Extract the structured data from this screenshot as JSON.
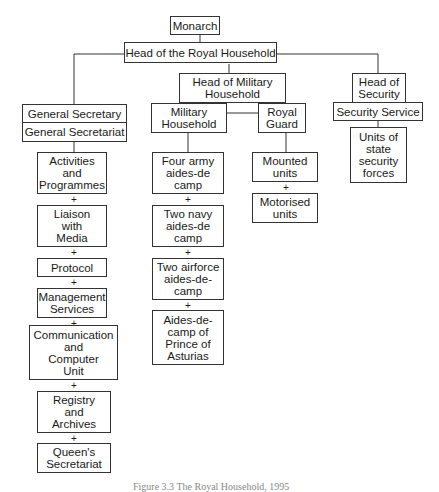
{
  "diagram": {
    "type": "organisational-chart",
    "root": "Monarch",
    "head": "Head of the Royal Household",
    "branches": {
      "secretariat": {
        "head": "General Secretary",
        "unit": "General Secretariat",
        "children": [
          "Activities\nand\nProgrammes",
          "Liaison\nwith\nMedia",
          "Protocol",
          "Management\nServices",
          "Communication\nand\nComputer\nUnit",
          "Registry\nand\nArchives",
          "Queen's\nSecretariat"
        ]
      },
      "military": {
        "head": "Head of Military\nHousehold",
        "military_household": "Military\nHousehold",
        "royal_guard": "Royal\nGuard",
        "military_children": [
          "Four army\naides-de\ncamp",
          "Two navy\naides-de\ncamp",
          "Two airforce\naides-de-\ncamp",
          "Aides-de-\ncamp of\nPrince of\nAsturias"
        ],
        "guard_children": [
          "Mounted\nunits",
          "Motorised\nunits"
        ]
      },
      "security": {
        "head": "Head of\nSecurity",
        "unit": "Security Service",
        "children": [
          "Units of\nstate\nsecurity\nforces"
        ]
      }
    },
    "connector_symbol": "+",
    "caption": "Figure 3.3 The Royal Household, 1995"
  }
}
